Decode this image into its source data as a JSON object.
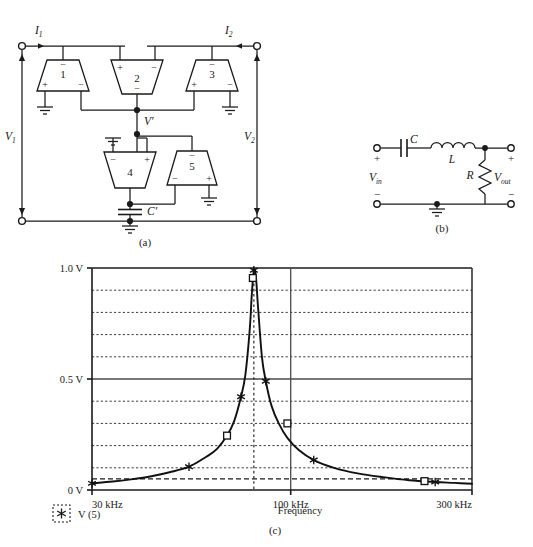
{
  "figure": {
    "panels": [
      {
        "id": "a",
        "caption": "(a)",
        "type": "op-amp-gyrator-circuit"
      },
      {
        "id": "b",
        "caption": "(b)",
        "type": "rlc-bandpass-circuit"
      },
      {
        "id": "c",
        "caption": "(c)",
        "type": "frequency-response-plot"
      }
    ]
  },
  "panel_a": {
    "caption": "(a)",
    "currents": [
      {
        "name": "I1",
        "base": "I",
        "sub": "1"
      },
      {
        "name": "I2",
        "base": "I",
        "sub": "2"
      }
    ],
    "voltages": [
      {
        "name": "V1",
        "base": "V",
        "sub": "1"
      },
      {
        "name": "V2",
        "base": "V",
        "sub": "2"
      }
    ],
    "node_label": "V′",
    "capacitor_label": "C′",
    "opamps": [
      {
        "num": "1",
        "orientation": "up",
        "signs": {
          "top": "−",
          "bottom_left": "+",
          "bottom_right": "−"
        }
      },
      {
        "num": "2",
        "orientation": "down",
        "signs": {
          "top_left": "+",
          "top_right": "−",
          "bottom": "−"
        }
      },
      {
        "num": "3",
        "orientation": "up",
        "signs": {
          "top": "−",
          "bottom_left": "+",
          "bottom_right": "−"
        }
      },
      {
        "num": "4",
        "orientation": "down",
        "signs": {
          "top_left": "−",
          "top_right": "+",
          "bottom": ""
        }
      },
      {
        "num": "5",
        "orientation": "up",
        "signs": {
          "top": "−",
          "bottom_left": "−",
          "bottom_right": "+"
        }
      }
    ]
  },
  "panel_b": {
    "caption": "(b)",
    "components": [
      {
        "type": "capacitor",
        "label": "C"
      },
      {
        "type": "inductor",
        "label": "L"
      },
      {
        "type": "resistor",
        "label": "R"
      }
    ],
    "terminals": {
      "input_label_base": "V",
      "input_label_sub": "in",
      "output_label_base": "V",
      "output_label_sub": "out",
      "plus": "+",
      "minus": "−"
    }
  },
  "panel_c": {
    "caption": "(c)",
    "legend": {
      "marker": "star-marker",
      "text": "V (5)"
    },
    "xlabel": "Frequency"
  },
  "chart_data": {
    "type": "line",
    "title": "",
    "xlabel": "Frequency",
    "ylabel": "",
    "xscale": "log",
    "xlim": [
      30,
      300
    ],
    "ylim": [
      0,
      1.0
    ],
    "xticks": [
      30,
      100,
      300
    ],
    "xticklabels": [
      "30 kHz",
      "100 kHz",
      "300 kHz"
    ],
    "yticks": [
      0,
      0.5,
      1.0
    ],
    "yticklabels": [
      "0 V",
      "0.5 V",
      "1.0 V"
    ],
    "grid": {
      "horizontal_dotted_step": 0.1,
      "horizontal_solid": [
        0.5,
        1.0
      ],
      "horizontal_dashed": [
        0.05
      ],
      "vertical_solid": [
        100
      ],
      "vertical_dotted": [
        80
      ]
    },
    "legend": {
      "position": "below-left",
      "entries": [
        {
          "name": "V (5)",
          "marker": "star"
        }
      ]
    },
    "series": [
      {
        "name": "V (5)",
        "units": "V",
        "x": [
          30,
          34,
          38,
          43,
          48,
          54,
          60,
          64,
          68,
          71,
          74,
          76,
          78,
          79,
          80,
          81,
          82,
          84,
          86,
          89,
          93,
          98,
          105,
          115,
          130,
          150,
          175,
          205,
          240,
          270,
          300
        ],
        "y": [
          0.03,
          0.038,
          0.048,
          0.062,
          0.08,
          0.105,
          0.15,
          0.185,
          0.245,
          0.31,
          0.42,
          0.52,
          0.72,
          0.88,
          0.99,
          0.96,
          0.83,
          0.6,
          0.49,
          0.38,
          0.3,
          0.235,
          0.18,
          0.135,
          0.1,
          0.075,
          0.058,
          0.044,
          0.036,
          0.032,
          0.028
        ]
      }
    ],
    "markers": {
      "star": [
        {
          "x": 30,
          "y": 0.03
        },
        {
          "x": 54,
          "y": 0.105
        },
        {
          "x": 74,
          "y": 0.42
        },
        {
          "x": 80,
          "y": 0.99
        },
        {
          "x": 86,
          "y": 0.49
        },
        {
          "x": 115,
          "y": 0.135
        },
        {
          "x": 240,
          "y": 0.036
        }
      ],
      "square": [
        {
          "x": 68,
          "y": 0.245
        },
        {
          "x": 79.5,
          "y": 0.955
        },
        {
          "x": 98,
          "y": 0.3
        },
        {
          "x": 225,
          "y": 0.04
        }
      ]
    },
    "peak": {
      "x": 80,
      "y": 1.0
    }
  }
}
